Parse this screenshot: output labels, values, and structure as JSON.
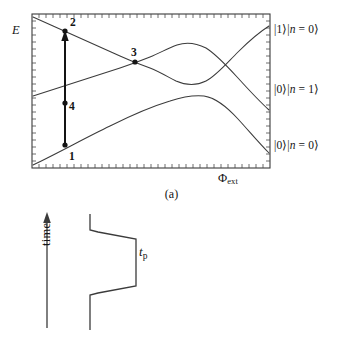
{
  "figure": {
    "kind": "two-panel scientific figure",
    "background_color": "#ffffff",
    "line_color": "#3b3b3b",
    "text_color": "#141414"
  },
  "panel_a": {
    "caption": "(a)",
    "y_axis_label": "E",
    "x_axis_label_symbol": "Φ",
    "x_axis_label_subscript": "ext",
    "frame": {
      "left": 32,
      "top": 14,
      "right": 270,
      "bottom": 168
    },
    "tick_count_x": 34,
    "tick_count_y": 22,
    "state_labels": [
      {
        "id": "state-upper",
        "bra": "|1⟩|",
        "n_sym": "n",
        "rest": " = 0⟩"
      },
      {
        "id": "state-middle",
        "bra": "|0⟩|",
        "n_sym": "n",
        "rest": " = 1⟩"
      },
      {
        "id": "state-lower",
        "bra": "|0⟩|",
        "n_sym": "n",
        "rest": " = 0⟩"
      }
    ],
    "state_label_text": {
      "upper": "|1⟩|n = 0⟩",
      "middle": "|0⟩|n = 1⟩",
      "lower": "|0⟩|n = 0⟩"
    },
    "marked_points": [
      {
        "label": "1",
        "x": 65,
        "y": 145
      },
      {
        "label": "2",
        "x": 65,
        "y": 31
      },
      {
        "label": "3",
        "x": 135,
        "y": 62
      },
      {
        "label": "4",
        "x": 65,
        "y": 103
      }
    ],
    "arrow": {
      "from_label": "1",
      "to_label": "2",
      "x": 65,
      "y_start": 145,
      "y_end": 31,
      "direction": "up"
    }
  },
  "panel_b": {
    "caption": "(b)",
    "time_axis_label": "time",
    "pulse_duration_symbol": "t",
    "pulse_duration_subscript": "p",
    "pulse_duration_label": "tp",
    "time_arrow": {
      "x": 47,
      "y_bottom": 128,
      "y_top": 14,
      "direction": "up"
    }
  }
}
